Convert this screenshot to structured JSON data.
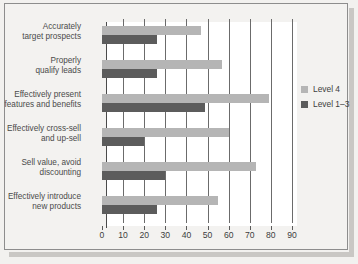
{
  "chart_data": {
    "type": "bar",
    "orientation": "horizontal",
    "title": "",
    "xlabel": "",
    "ylabel": "",
    "xlim": [
      0,
      90
    ],
    "xticks": [
      0,
      10,
      20,
      30,
      40,
      50,
      60,
      70,
      80,
      90
    ],
    "grid": true,
    "legend_position": "right",
    "categories": [
      "Accurately\ntarget prospects",
      "Properly\nqualify leads",
      "Effectively present\nfeatures and benefits",
      "Effectively cross-sell\nand up-sell",
      "Sell value, avoid\ndiscounting",
      "Effectively introduce\nnew products"
    ],
    "category_lines": [
      [
        "Accurately",
        "target prospects"
      ],
      [
        "Properly",
        "qualify leads"
      ],
      [
        "Effectively present",
        "features and benefits"
      ],
      [
        "Effectively cross-sell",
        "and up-sell"
      ],
      [
        "Sell value, avoid",
        "discounting"
      ],
      [
        "Effectively introduce",
        "new products"
      ]
    ],
    "series": [
      {
        "name": "Level 4",
        "color": "#b5b5b5",
        "values": [
          47,
          57,
          79,
          60,
          73,
          55
        ]
      },
      {
        "name": "Level 1–3",
        "color": "#5c5c5c",
        "values": [
          26,
          26,
          49,
          20,
          30,
          26
        ]
      }
    ]
  },
  "legend": {
    "items": [
      {
        "label": "Level 4",
        "color": "#b5b5b5"
      },
      {
        "label": "Level 1–3",
        "color": "#5c5c5c"
      }
    ]
  },
  "ticks": {
    "labels": [
      "0",
      "10",
      "20",
      "30",
      "40",
      "50",
      "60",
      "70",
      "80",
      "90"
    ]
  },
  "colors": {
    "level4": "#b5b5b5",
    "level13": "#5c5c5c",
    "panel": "#f3f2f0",
    "plot": "#ffffff",
    "grid": "#6b6b6b",
    "text": "#3d3d3d"
  }
}
